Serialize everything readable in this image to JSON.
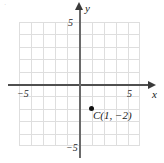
{
  "figure": {
    "background_color": "#ffffff",
    "grid_color": "#dedede",
    "axis_color": "#4f4f4f",
    "point_color": "#111111",
    "artifact_mark": "·"
  },
  "axes": {
    "x_name": "x",
    "y_name": "y",
    "x_ticks": [
      {
        "label": "−5",
        "value": -5
      },
      {
        "label": "5",
        "value": 5
      }
    ],
    "y_ticks": [
      {
        "label": "5",
        "value": 5
      },
      {
        "label": "−5",
        "value": -5
      }
    ]
  },
  "chart_data": {
    "type": "scatter",
    "title": "",
    "xlabel": "x",
    "ylabel": "y",
    "xlim": [
      -5,
      5
    ],
    "ylim": [
      -5,
      5
    ],
    "xticks": [
      -5,
      5
    ],
    "yticks": [
      -5,
      5
    ],
    "xtick_labels": [
      "−5",
      "5"
    ],
    "ytick_labels": [
      "−5",
      "5"
    ],
    "grid": true,
    "grid_step": 1,
    "legend": "none",
    "points": [
      {
        "name": "C",
        "x": 1,
        "y": -2,
        "label": "C(1, −2)",
        "marker": "filled-circle"
      }
    ]
  }
}
